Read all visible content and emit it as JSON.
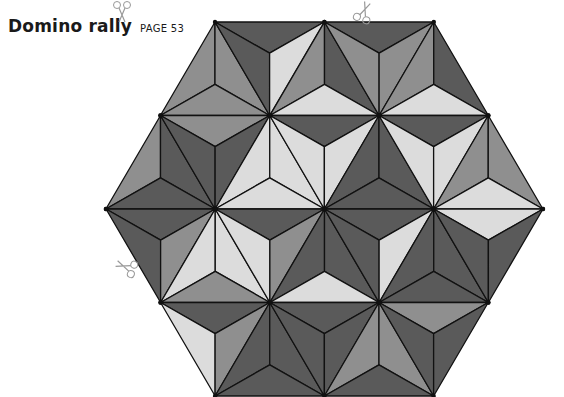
{
  "header": {
    "title": "Domino rally",
    "page_ref": "PAGE 53"
  },
  "colors": {
    "L": "#dcdcdc",
    "M": "#8f8f8f",
    "D": "#5a5a5a",
    "line": "#111111"
  },
  "icons": [
    {
      "name": "scissors-icon",
      "x": 352,
      "y": 0,
      "rotate": 20
    },
    {
      "name": "scissors-icon",
      "x": 110,
      "y": 0,
      "rotate": 180
    },
    {
      "name": "scissors-icon",
      "x": 114,
      "y": 255,
      "rotate": -70
    }
  ],
  "hexagon": {
    "rows_y": [
      22,
      115.5,
      209,
      302.5,
      396
    ],
    "rows": [
      {
        "row": 0,
        "triangles": [
          {
            "type": "U",
            "apex_x": 215.0,
            "pieces": [
              "M",
              "M",
              "M"
            ]
          },
          {
            "type": "D",
            "left_x": 215.0,
            "pieces": [
              "D",
              "D",
              "L"
            ]
          },
          {
            "type": "U",
            "apex_x": 324.5,
            "pieces": [
              "M",
              "D",
              "L"
            ]
          },
          {
            "type": "D",
            "left_x": 324.5,
            "pieces": [
              "D",
              "M",
              "M"
            ]
          },
          {
            "type": "U",
            "apex_x": 433.75,
            "pieces": [
              "M",
              "D",
              "L"
            ]
          }
        ]
      },
      {
        "row": 1,
        "triangles": [
          {
            "type": "U",
            "apex_x": 160.5,
            "pieces": [
              "M",
              "D",
              "D"
            ]
          },
          {
            "type": "D",
            "left_x": 160.5,
            "pieces": [
              "M",
              "D",
              "D"
            ]
          },
          {
            "type": "U",
            "apex_x": 269.75,
            "pieces": [
              "L",
              "L",
              "L"
            ]
          },
          {
            "type": "D",
            "left_x": 269.75,
            "pieces": [
              "D",
              "L",
              "L"
            ]
          },
          {
            "type": "U",
            "apex_x": 379.0,
            "pieces": [
              "D",
              "D",
              "D"
            ]
          },
          {
            "type": "D",
            "left_x": 379.0,
            "pieces": [
              "D",
              "L",
              "L"
            ]
          },
          {
            "type": "U",
            "apex_x": 488.25,
            "pieces": [
              "M",
              "M",
              "L"
            ]
          }
        ]
      },
      {
        "row": 2,
        "triangles": [
          {
            "type": "D",
            "left_x": 106.0,
            "pieces": [
              "D",
              "D",
              "M"
            ]
          },
          {
            "type": "U",
            "apex_x": 215.25,
            "pieces": [
              "L",
              "L",
              "M"
            ]
          },
          {
            "type": "D",
            "left_x": 215.25,
            "pieces": [
              "D",
              "L",
              "M"
            ]
          },
          {
            "type": "U",
            "apex_x": 324.5,
            "pieces": [
              "D",
              "D",
              "L"
            ]
          },
          {
            "type": "D",
            "left_x": 324.5,
            "pieces": [
              "D",
              "D",
              "L"
            ]
          },
          {
            "type": "U",
            "apex_x": 433.75,
            "pieces": [
              "D",
              "D",
              "D"
            ]
          },
          {
            "type": "D",
            "left_x": 433.75,
            "pieces": [
              "L",
              "D",
              "D"
            ]
          }
        ]
      },
      {
        "row": 3,
        "triangles": [
          {
            "type": "D",
            "left_x": 160.5,
            "pieces": [
              "D",
              "L",
              "M"
            ]
          },
          {
            "type": "U",
            "apex_x": 269.75,
            "pieces": [
              "D",
              "D",
              "D"
            ]
          },
          {
            "type": "D",
            "left_x": 269.75,
            "pieces": [
              "D",
              "D",
              "D"
            ]
          },
          {
            "type": "U",
            "apex_x": 379.0,
            "pieces": [
              "M",
              "M",
              "D"
            ]
          },
          {
            "type": "D",
            "left_x": 379.0,
            "pieces": [
              "M",
              "D",
              "D"
            ]
          }
        ]
      }
    ],
    "side": 109.25
  }
}
